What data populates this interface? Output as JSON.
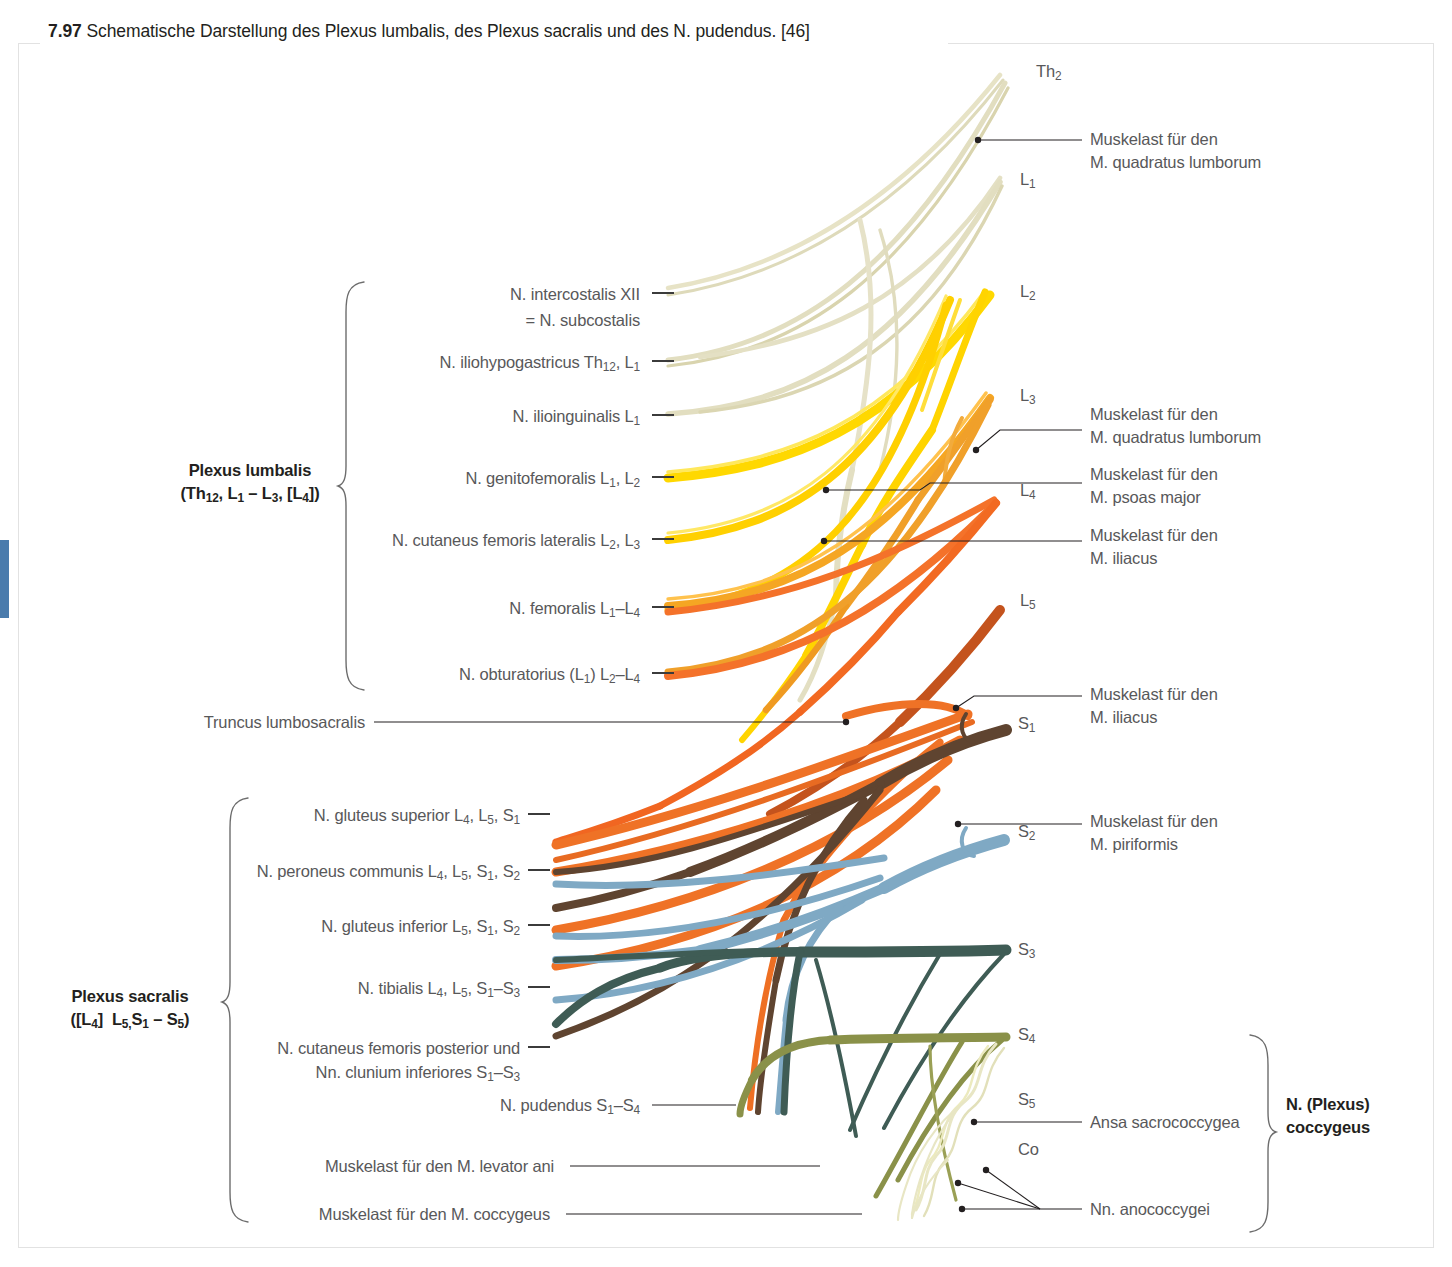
{
  "figure": {
    "number": "7.97",
    "caption": "Schematische Darstellung des Plexus lumbalis, des Plexus sacralis und des N. pudendus. [46]"
  },
  "colors": {
    "th12_l1": "#e3dfbe",
    "l1": "#ddd7a4",
    "l2": "#ffdf00",
    "l3": "#f0a02a",
    "l4": "#f0722a",
    "l5": "#c4531d",
    "s1": "#5f4430",
    "s2": "#7fa9c4",
    "s3": "#3f5c55",
    "s4": "#8a9149",
    "s5_co": "#e8e6c4",
    "tab_blue": "#4a7bac",
    "text_grey": "#58585a",
    "text_black": "#231f20",
    "frame": "#e2e2e2"
  },
  "plexus_lumbalis": {
    "title": "Plexus lumbalis",
    "roots": "(Th12, L1 – L3, [L4])",
    "nerves": [
      {
        "name": "N. intercostalis XII",
        "name2": "= N. subcostalis"
      },
      {
        "name": "N. iliohypogastricus Th12, L1"
      },
      {
        "name": "N. ilioinguinalis L1"
      },
      {
        "name": "N. genitofemoralis L1, L2"
      },
      {
        "name": "N. cutaneus femoris lateralis L2, L3"
      },
      {
        "name": "N. femoralis L1–L4"
      },
      {
        "name": "N. obturatorius (L1) L2–L4"
      }
    ]
  },
  "truncus": {
    "label": "Truncus lumbosacralis"
  },
  "plexus_sacralis": {
    "title": "Plexus sacralis",
    "roots": "([L4]  L5,S1 – S5)",
    "nerves": [
      {
        "name": "N. gluteus superior L4, L5, S1"
      },
      {
        "name": "N. peroneus communis L4, L5, S1, S2"
      },
      {
        "name": "N. gluteus inferior L5, S1, S2"
      },
      {
        "name": "N. tibialis L4, L5, S1–S3"
      },
      {
        "name": "N. cutaneus femoris posterior und",
        "name2": "Nn. clunium inferiores S1–S3"
      },
      {
        "name": "N. pudendus S1–S4"
      },
      {
        "name": "Muskelast für den M. levator ani"
      },
      {
        "name": "Muskelast für den M. coccygeus"
      }
    ]
  },
  "plexus_coccygeus": {
    "title_line1": "N. (Plexus)",
    "title_line2": "coccygeus",
    "nerves": [
      {
        "name": "Ansa sacrococcygea"
      },
      {
        "name": "Nn. anococcygei"
      }
    ]
  },
  "spinal_roots": [
    {
      "id": "th2",
      "label": "Th2",
      "x": 1036,
      "y": 71
    },
    {
      "id": "l1",
      "label": "L1",
      "x": 1020,
      "y": 178
    },
    {
      "id": "l2",
      "label": "L2",
      "x": 1020,
      "y": 290
    },
    {
      "id": "l3",
      "label": "L3",
      "x": 1020,
      "y": 394
    },
    {
      "id": "l4",
      "label": "L4",
      "x": 1020,
      "y": 489
    },
    {
      "id": "l5",
      "label": "L5",
      "x": 1020,
      "y": 598
    },
    {
      "id": "s1",
      "label": "S1",
      "x": 1018,
      "y": 722
    },
    {
      "id": "s2",
      "label": "S2",
      "x": 1018,
      "y": 830
    },
    {
      "id": "s3",
      "label": "S3",
      "x": 1018,
      "y": 948
    },
    {
      "id": "s4",
      "label": "S4",
      "x": 1018,
      "y": 1033
    },
    {
      "id": "s5",
      "label": "S5",
      "x": 1018,
      "y": 1098
    },
    {
      "id": "co",
      "label": "Co",
      "x": 1018,
      "y": 1148
    }
  ],
  "muscle_branches": [
    {
      "id": "quadratus-lumborum-th12",
      "line1": "Muskelast für den",
      "line2": "M. quadratus lumborum",
      "x": 1091,
      "y": 129
    },
    {
      "id": "quadratus-lumborum-l3",
      "line1": "Muskelast für den",
      "line2": "M. quadratus lumborum",
      "x": 1091,
      "y": 404
    },
    {
      "id": "psoas-major",
      "line1": "Muskelast für den",
      "line2": "M. psoas major",
      "x": 1091,
      "y": 464
    },
    {
      "id": "iliacus-l4",
      "line1": "Muskelast für den",
      "line2": "M. iliacus",
      "x": 1091,
      "y": 525
    },
    {
      "id": "iliacus-s1",
      "line1": "Muskelast für den",
      "line2": "M. iliacus",
      "x": 1091,
      "y": 684
    },
    {
      "id": "piriformis",
      "line1": "Muskelast für den",
      "line2": "M. piriformis",
      "x": 1091,
      "y": 811
    }
  ]
}
